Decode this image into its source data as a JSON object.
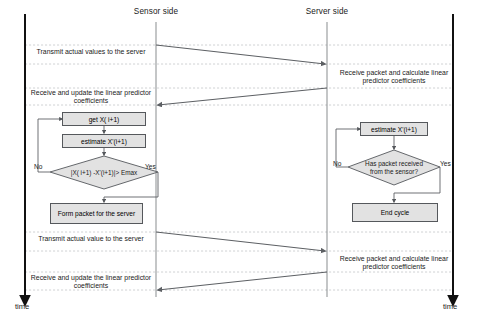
{
  "diagram": {
    "lifelines": [
      {
        "id": "sensor",
        "label": "Sensor side"
      },
      {
        "id": "server",
        "label": "Server side"
      }
    ],
    "axes": [
      {
        "id": "left-time-axis",
        "label": "time"
      },
      {
        "id": "right-time-axis",
        "label": "time"
      }
    ],
    "messages": [
      {
        "id": "m1",
        "label": "Transmit actual values to the server",
        "from": "sensor",
        "to": "server"
      },
      {
        "id": "m2",
        "label": "Receive and update  the linear predictor\ncoefficients",
        "from": "server",
        "to": "sensor"
      },
      {
        "id": "m3",
        "label": "Transmit actual value to the server",
        "from": "sensor",
        "to": "server"
      },
      {
        "id": "m4",
        "label": "Receive and update  the linear predictor\ncoefficients",
        "from": "server",
        "to": "sensor"
      }
    ],
    "activities": [
      {
        "id": "a1",
        "label": "Receive packet and calculate linear\npredictor coefficients",
        "side": "server"
      },
      {
        "id": "a2",
        "label": "Receive packet and calculate linear\npredictor coefficients",
        "side": "server"
      }
    ],
    "sensor_flow": {
      "nodes": [
        {
          "id": "get-x",
          "type": "process",
          "label": "get X( i+1)"
        },
        {
          "id": "estimate-x",
          "type": "process",
          "label": "estimate X'(i+1)"
        },
        {
          "id": "threshold-check",
          "type": "decision",
          "label": "|X( i+1) -X'(i+1)|> Emax"
        },
        {
          "id": "form-packet",
          "type": "process",
          "label": "Form packet for the server"
        }
      ],
      "branches": [
        {
          "id": "threshold-no",
          "label": "No"
        },
        {
          "id": "threshold-yes",
          "label": "Yes"
        }
      ]
    },
    "server_flow": {
      "nodes": [
        {
          "id": "estimate-x-server",
          "type": "process",
          "label": "estimate X'(i+1)"
        },
        {
          "id": "packet-check",
          "type": "decision",
          "label": "Has packet received\nfrom the sensor?"
        },
        {
          "id": "end-cycle",
          "type": "process",
          "label": "End cycle"
        }
      ],
      "branches": [
        {
          "id": "packet-no",
          "label": "No"
        },
        {
          "id": "packet-yes",
          "label": "Yes"
        }
      ]
    },
    "colors": {
      "node_fill": "#e2e2e2",
      "node_stroke": "#55585c",
      "line": "#6b6e72",
      "axis": "#111111",
      "text": "#1a1a1a",
      "dashed_guide": "#a9acb0"
    }
  }
}
